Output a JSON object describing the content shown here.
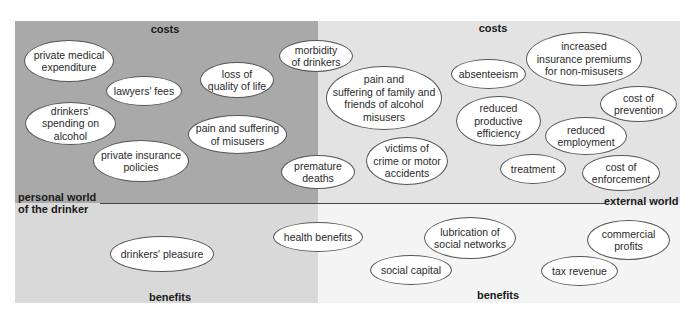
{
  "colors": {
    "personal_costs_bg": "#a9a9a9",
    "external_costs_bg": "#e3e3e3",
    "personal_benefits_bg": "#d9d9d9",
    "external_benefits_bg": "#f4f4f4",
    "bubble_fill": "#ffffff",
    "bubble_border": "#555555",
    "divider": "#444444"
  },
  "headings": {
    "personal_costs": "costs",
    "external_costs": "costs",
    "personal_benefits": "benefits",
    "external_benefits": "benefits"
  },
  "axis_labels": {
    "personal_world": "personal world\nof the drinker",
    "external_world": "external world"
  },
  "personal_costs": [
    {
      "id": "private-medical-expenditure",
      "label": "private medical\nexpenditure"
    },
    {
      "id": "lawyers-fees",
      "label": "lawyers' fees"
    },
    {
      "id": "loss-of-quality-of-life",
      "label": "loss of\nquality of life"
    },
    {
      "id": "drinkers-spending-on-alcohol",
      "label": "drinkers'\nspending on\nalcohol"
    },
    {
      "id": "pain-and-suffering-of-misusers",
      "label": "pain and suffering\nof misusers"
    },
    {
      "id": "private-insurance-policies",
      "label": "private insurance\npolicies"
    }
  ],
  "external_costs": [
    {
      "id": "morbidity-of-drinkers",
      "label": "morbidity\nof drinkers"
    },
    {
      "id": "pain-suffering-family-friends",
      "label": "pain and\nsuffering of family and\nfriends of alcohol\nmisusers"
    },
    {
      "id": "premature-deaths",
      "label": "premature\ndeaths"
    },
    {
      "id": "victims-of-crime",
      "label": "victims of\ncrime or motor\naccidents"
    },
    {
      "id": "absenteeism",
      "label": "absenteeism"
    },
    {
      "id": "increased-insurance-premiums",
      "label": "increased\ninsurance premiums\nfor non-misusers"
    },
    {
      "id": "reduced-productive-efficiency",
      "label": "reduced\nproductive\nefficiency"
    },
    {
      "id": "cost-of-prevention",
      "label": "cost of\nprevention"
    },
    {
      "id": "reduced-employment",
      "label": "reduced\nemployment"
    },
    {
      "id": "treatment",
      "label": "treatment"
    },
    {
      "id": "cost-of-enforcement",
      "label": "cost of\nenforcement"
    }
  ],
  "personal_benefits": [
    {
      "id": "drinkers-pleasure",
      "label": "drinkers' pleasure"
    }
  ],
  "external_benefits": [
    {
      "id": "health-benefits",
      "label": "health benefits"
    },
    {
      "id": "lubrication-of-social-networks",
      "label": "lubrication of\nsocial networks"
    },
    {
      "id": "social-capital",
      "label": "social capital"
    },
    {
      "id": "commercial-profits",
      "label": "commercial\nprofits"
    },
    {
      "id": "tax-revenue",
      "label": "tax revenue"
    }
  ]
}
